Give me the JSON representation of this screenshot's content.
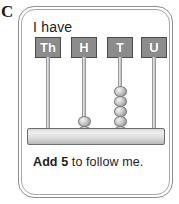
{
  "item": {
    "letter": "C"
  },
  "card": {
    "prompt": "I have",
    "instruction": {
      "bold_part": "Add 5",
      "rest_part": " to follow me."
    }
  },
  "abacus": {
    "columns": [
      {
        "label": "Th",
        "beads": 0
      },
      {
        "label": "H",
        "beads": 2
      },
      {
        "label": "T",
        "beads": 5
      },
      {
        "label": "U",
        "beads": 0
      }
    ]
  },
  "chart_data": {
    "type": "bar",
    "categories": [
      "Th",
      "H",
      "T",
      "U"
    ],
    "values": [
      0,
      2,
      5,
      0
    ],
    "xlabel": "Place value column",
    "ylabel": "Number of beads",
    "ylim": [
      0,
      9
    ],
    "annotations": [
      "I have",
      "Add 5 to follow me."
    ],
    "represented_number": 250
  },
  "colors": {
    "label_box_fill": "#8c8c8c",
    "label_box_border": "#4b4b4b",
    "label_text": "#ffffff",
    "bead_fill": "#c8c8c8",
    "bead_border": "#7d7d7d",
    "rod": "#cfcfcf",
    "base_bar": "#dcdcdc",
    "card_border": "#8e8e8e",
    "text": "#1d1d1d",
    "background": "#ffffff"
  }
}
